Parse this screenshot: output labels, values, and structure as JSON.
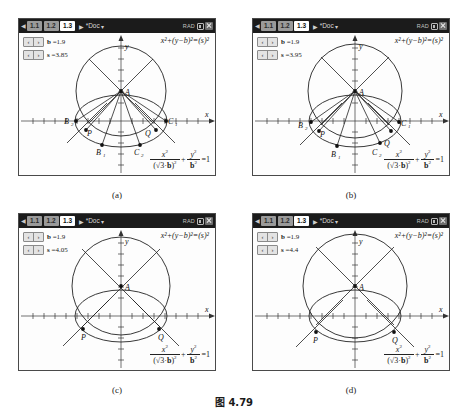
{
  "figure": {
    "caption": "图 4.79"
  },
  "header": {
    "tabs": [
      {
        "label": "1.1",
        "active": false
      },
      {
        "label": "1.2",
        "active": false
      },
      {
        "label": "1.3",
        "active": true
      }
    ],
    "doc_name": "*Doc",
    "angle_mode": "RAD",
    "battery_icon": "battery-icon",
    "close_icon": "close-icon",
    "left_arrow_icon": "chevron-left-icon",
    "caret_icon": "chevron-right-icon",
    "doc_chevron_icon": "chevron-down-icon"
  },
  "equations": {
    "circle_lhs_x": "x",
    "circle": "x²+(y−b)²=(s)²",
    "ellipse": "x²/((√3·b)²) + y²/b² = 1",
    "num_x": "x",
    "den_root": "3",
    "den_b": "b",
    "num_y": "y",
    "den_b2": "b",
    "rhs": "=1",
    "plus": "+"
  },
  "sliders": {
    "prev_icon": "chevron-left-icon",
    "next_icon": "chevron-right-icon",
    "prev_label": "‹",
    "next_label": "›"
  },
  "panels": [
    {
      "id": "a",
      "subcaption": "(a)",
      "slider_b_name": "b",
      "slider_b_value": "=1.9",
      "slider_s_name": "s",
      "slider_s_value": "=3.85",
      "b": 1.9,
      "s": 3.85,
      "labels": [
        "A",
        "B₂",
        "P",
        "Q",
        "C₁",
        "B₁",
        "C₂"
      ],
      "axis_label_x": "x",
      "axis_label_y": "y"
    },
    {
      "id": "b",
      "subcaption": "(b)",
      "slider_b_name": "b",
      "slider_b_value": "=1.9",
      "slider_s_name": "s",
      "slider_s_value": "=3.95",
      "b": 1.9,
      "s": 3.95,
      "labels": [
        "A",
        "B₂",
        "P",
        "Q",
        "C₁",
        "B₁",
        "C₂"
      ],
      "axis_label_x": "x",
      "axis_label_y": "y"
    },
    {
      "id": "c",
      "subcaption": "(c)",
      "slider_b_name": "b",
      "slider_b_value": "=1.9",
      "slider_s_name": "s",
      "slider_s_value": "=4.05",
      "b": 1.9,
      "s": 4.05,
      "labels": [
        "A",
        "P",
        "Q"
      ],
      "axis_label_x": "x",
      "axis_label_y": "y"
    },
    {
      "id": "d",
      "subcaption": "(d)",
      "slider_b_name": "b",
      "slider_b_value": "=1.9",
      "slider_s_name": "s",
      "slider_s_value": "=4.4",
      "b": 1.9,
      "s": 4.4,
      "labels": [
        "A",
        "P",
        "Q"
      ],
      "axis_label_x": "x",
      "axis_label_y": "y"
    }
  ]
}
